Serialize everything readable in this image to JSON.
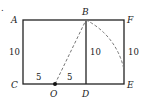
{
  "figure": {
    "marker": ".",
    "points": {
      "A": {
        "label": "A",
        "x": 23,
        "y": 20
      },
      "B": {
        "label": "B",
        "x": 86,
        "y": 20
      },
      "F": {
        "label": "F",
        "x": 124,
        "y": 20
      },
      "C": {
        "label": "C",
        "x": 23,
        "y": 84
      },
      "O": {
        "label": "O",
        "x": 55,
        "y": 84
      },
      "D": {
        "label": "D",
        "x": 86,
        "y": 84
      },
      "E": {
        "label": "E",
        "x": 124,
        "y": 84
      }
    },
    "measurements": {
      "AC": "10",
      "BD": "10",
      "FE": "10",
      "CO": "5",
      "OD": "5"
    },
    "colors": {
      "line": "#222222",
      "dashed": "#777777"
    }
  }
}
